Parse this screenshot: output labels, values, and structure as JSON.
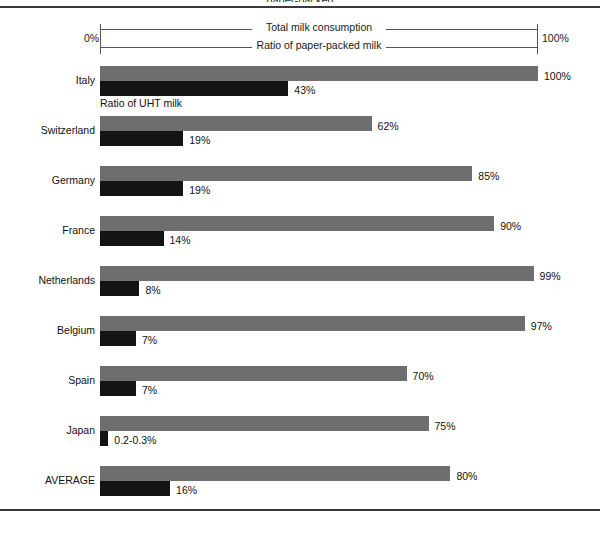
{
  "figure": {
    "clipped_title": "paper-packed",
    "axis": {
      "min_label": "0%",
      "max_label": "100%",
      "upper_bracket_label": "Total milk consumption",
      "lower_bracket_label": "Ratio of paper-packed milk"
    },
    "inline_note": "Ratio of UHT milk",
    "colors": {
      "total_bar": "#6e6e6e",
      "uht_bar": "#141414",
      "rule": "#3a3a3a",
      "bracket": "#555555",
      "text": "#111111",
      "background": "#ffffff"
    }
  },
  "chart_data": {
    "type": "bar",
    "title": "",
    "xlabel": "",
    "ylabel": "",
    "xlim": [
      0,
      100
    ],
    "grid": false,
    "orientation": "horizontal",
    "legend": [
      "Total milk consumption / Ratio of paper-packed milk",
      "Ratio of UHT milk"
    ],
    "categories": [
      "Italy",
      "Switzerland",
      "Germany",
      "France",
      "Netherlands",
      "Belgium",
      "Spain",
      "Japan",
      "AVERAGE"
    ],
    "series": [
      {
        "name": "Ratio of paper-packed milk",
        "values": [
          100,
          62,
          85,
          90,
          99,
          97,
          70,
          75,
          80
        ],
        "labels": [
          "100%",
          "62%",
          "85%",
          "90%",
          "99%",
          "97%",
          "70%",
          "75%",
          "80%"
        ]
      },
      {
        "name": "Ratio of UHT milk",
        "values": [
          43,
          19,
          19,
          14,
          8,
          7,
          7,
          0.25,
          16
        ],
        "labels": [
          "43%",
          "19%",
          "19%",
          "14%",
          "8%",
          "7%",
          "7%",
          "0.2-0.3%",
          "16%"
        ]
      }
    ]
  },
  "rows": [
    {
      "label": "Italy",
      "total": 100,
      "total_label": "100%",
      "uht": 43,
      "uht_label": "43%",
      "uht_draw": 43
    },
    {
      "label": "Switzerland",
      "total": 62,
      "total_label": "62%",
      "uht": 19,
      "uht_label": "19%",
      "uht_draw": 19
    },
    {
      "label": "Germany",
      "total": 85,
      "total_label": "85%",
      "uht": 19,
      "uht_label": "19%",
      "uht_draw": 19
    },
    {
      "label": "France",
      "total": 90,
      "total_label": "90%",
      "uht": 14,
      "uht_label": "14%",
      "uht_draw": 14.5
    },
    {
      "label": "Netherlands",
      "total": 99,
      "total_label": "99%",
      "uht": 8,
      "uht_label": "8%",
      "uht_draw": 9
    },
    {
      "label": "Belgium",
      "total": 97,
      "total_label": "97%",
      "uht": 7,
      "uht_label": "7%",
      "uht_draw": 8.2
    },
    {
      "label": "Spain",
      "total": 70,
      "total_label": "70%",
      "uht": 7,
      "uht_label": "7%",
      "uht_draw": 8.2
    },
    {
      "label": "Japan",
      "total": 75,
      "total_label": "75%",
      "uht": 0.25,
      "uht_label": "0.2-0.3%",
      "uht_draw": 1.9
    },
    {
      "label": "AVERAGE",
      "total": 80,
      "total_label": "80%",
      "uht": 16,
      "uht_label": "16%",
      "uht_draw": 16
    }
  ]
}
